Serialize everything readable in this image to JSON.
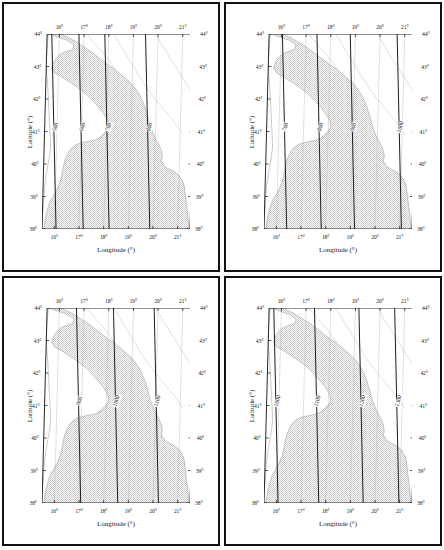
{
  "figure": {
    "kind": "four-panel contour map",
    "region": "Adriatic Sea / Italy / Balkan peninsula"
  },
  "axes": {
    "xlabel": "Longitude (°)",
    "ylabel": "Latitude (°)",
    "xticks": [
      "16°",
      "17°",
      "18°",
      "19°",
      "20°",
      "21°"
    ],
    "xtick_values": [
      16,
      17,
      18,
      19,
      20,
      21
    ],
    "yticks": [
      "44°",
      "43°",
      "42°",
      "41°",
      "40°",
      "39°",
      "38°"
    ],
    "ytick_values": [
      44,
      43,
      42,
      41,
      40,
      39,
      38
    ],
    "xlim": [
      15.5,
      21.5
    ],
    "ylim": [
      38,
      44
    ]
  },
  "colors": {
    "land_fill": "#ffffff",
    "sea_fill": "#c9c9c9",
    "contour_line": "#111111",
    "coastline": "#8a8a8a",
    "border_line": "#a8a8a8",
    "frame": "#111111",
    "text": "#1a1a1a"
  },
  "chart_data": {
    "type": "line",
    "title": "",
    "xlabel": "Longitude (°)",
    "ylabel": "Latitude (°)",
    "xlim": [
      15.5,
      21.5
    ],
    "ylim": [
      38,
      44
    ],
    "grid": false,
    "legend": "none",
    "panels": [
      {
        "id": "panel-1",
        "position": "top-left",
        "contour_labels": [
          "500",
          "600",
          "700",
          "800"
        ],
        "contour_values": [
          500,
          600,
          700,
          800
        ],
        "contour_interval": 100
      },
      {
        "id": "panel-2",
        "position": "top-right",
        "contour_labels": [
          "700",
          "800",
          "900",
          "1000"
        ],
        "contour_values": [
          700,
          800,
          900,
          1000
        ],
        "contour_interval": 100
      },
      {
        "id": "panel-3",
        "position": "bottom-left",
        "contour_labels": [
          "900",
          "1000",
          "1100"
        ],
        "contour_values": [
          900,
          1000,
          1100
        ],
        "contour_interval": 100
      },
      {
        "id": "panel-4",
        "position": "bottom-right",
        "contour_labels": [
          "1000",
          "1100",
          "1200",
          "1300"
        ],
        "contour_values": [
          1000,
          1100,
          1200,
          1300
        ],
        "contour_interval": 100
      }
    ]
  },
  "panels": [
    {
      "id": "panel-1",
      "xlabel": "Longitude (°)",
      "ylabel": "Latitude (°)",
      "contours": [
        {
          "label": "500",
          "x_at_41deg": 15.95
        },
        {
          "label": "600",
          "x_at_41deg": 17.05
        },
        {
          "label": "700",
          "x_at_41deg": 18.1
        },
        {
          "label": "800",
          "x_at_41deg": 19.75
        }
      ]
    },
    {
      "id": "panel-2",
      "xlabel": "Longitude (°)",
      "ylabel": "Latitude (°)",
      "contours": [
        {
          "label": "700",
          "x_at_41deg": 16.3
        },
        {
          "label": "800",
          "x_at_41deg": 17.7
        },
        {
          "label": "900",
          "x_at_41deg": 19.05
        },
        {
          "label": "1000",
          "x_at_41deg": 20.95
        }
      ]
    },
    {
      "id": "panel-3",
      "xlabel": "Longitude (°)",
      "ylabel": "Latitude (°)",
      "contours": [
        {
          "label": "900",
          "x_at_41deg": 16.95
        },
        {
          "label": "1000",
          "x_at_41deg": 18.45
        },
        {
          "label": "1100",
          "x_at_41deg": 20.1
        }
      ]
    },
    {
      "id": "panel-4",
      "xlabel": "Longitude (°)",
      "ylabel": "Latitude (°)",
      "contours": [
        {
          "label": "1000",
          "x_at_41deg": 15.95
        },
        {
          "label": "1100",
          "x_at_41deg": 17.6
        },
        {
          "label": "1200",
          "x_at_41deg": 19.4
        },
        {
          "label": "1300",
          "x_at_41deg": 20.85
        }
      ]
    }
  ]
}
